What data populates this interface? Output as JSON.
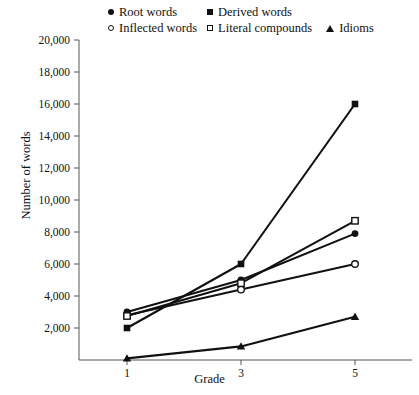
{
  "chart_data": {
    "type": "line",
    "title": "",
    "xlabel": "Grade",
    "ylabel": "Number of words",
    "x": [
      1,
      3,
      5
    ],
    "categories": [
      "1",
      "3",
      "5"
    ],
    "xtick_labels": [
      "1",
      "3",
      "5"
    ],
    "ytick_labels": [
      "2,000",
      "4,000",
      "6,000",
      "8,000",
      "10,000",
      "12,000",
      "14,000",
      "16,000",
      "18,000",
      "20,000"
    ],
    "ytick_values": [
      2000,
      4000,
      6000,
      8000,
      10000,
      12000,
      14000,
      16000,
      18000,
      20000
    ],
    "xlim": [
      0.5,
      5.8
    ],
    "ylim": [
      0,
      20000
    ],
    "grid": false,
    "legend_position": "top",
    "series": [
      {
        "name": "Root words",
        "marker": "filled-circle",
        "values": [
          3000,
          5000,
          7900
        ]
      },
      {
        "name": "Derived words",
        "marker": "filled-square",
        "values": [
          2000,
          6000,
          16000
        ]
      },
      {
        "name": "Inflected words",
        "marker": "open-circle",
        "values": [
          2800,
          4400,
          6000
        ]
      },
      {
        "name": "Literal compounds",
        "marker": "open-square",
        "values": [
          2750,
          4800,
          8700
        ]
      },
      {
        "name": "Idioms",
        "marker": "filled-triangle",
        "values": [
          100,
          850,
          2700
        ]
      }
    ]
  },
  "legend": {
    "row1": [
      {
        "label": "Root words",
        "marker": "filled-circle"
      },
      {
        "label": "Derived words",
        "marker": "filled-square"
      }
    ],
    "row2": [
      {
        "label": "Inflected words",
        "marker": "open-circle"
      },
      {
        "label": "Literal compounds",
        "marker": "open-square"
      },
      {
        "label": "Idioms",
        "marker": "filled-triangle"
      }
    ]
  },
  "axes": {
    "y_title": "Number of words",
    "x_title": "Grade"
  },
  "colors": {
    "line": "#111111",
    "axis": "#555555",
    "text": "#111111",
    "background": "#ffffff"
  }
}
